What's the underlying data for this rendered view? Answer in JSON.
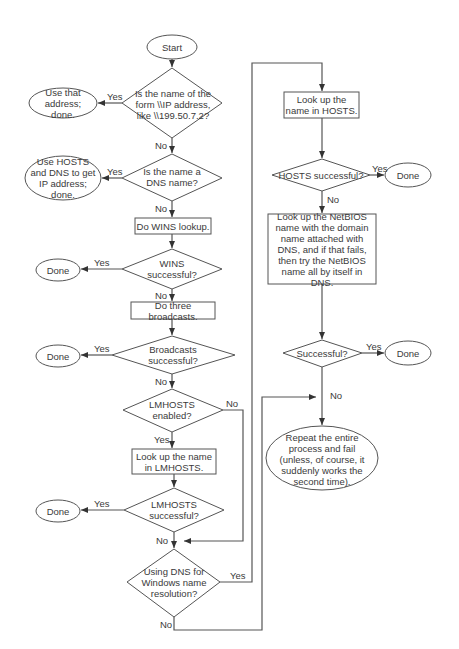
{
  "flowchart": {
    "nodes": {
      "start": "Start",
      "q_ip_form": "Is the name of the form \\\\IP address, like \\\\199.50.7.2?",
      "use_address": "Use that address; done.",
      "q_dns_name": "Is the name a DNS name?",
      "use_hosts_dns": "Use HOSTS and DNS to get IP address; done.",
      "wins_lookup": "Do WINS lookup.",
      "q_wins_ok": "WINS successful?",
      "done_wins": "Done",
      "broadcasts": "Do three broadcasts.",
      "q_broadcasts_ok": "Broadcasts successful?",
      "done_broadcasts": "Done",
      "q_lmhosts_enabled": "LMHOSTS enabled?",
      "lmhosts_lookup": "Look up the name in LMHOSTS.",
      "q_lmhosts_ok": "LMHOSTS successful?",
      "done_lmhosts": "Done",
      "q_dns_for_windows": "Using DNS for Windows name resolution?",
      "hosts_lookup": "Look up the name in HOSTS.",
      "q_hosts_ok": "HOSTS successful?",
      "done_hosts": "Done",
      "netbios_dns": "Look up the NetBIOS name with the domain name attached with DNS, and if that fails, then try the NetBIOS name all by itself in DNS.",
      "q_successful": "Successful?",
      "done_final": "Done",
      "repeat_fail": "Repeat the entire process and fail (unless, of course, it suddenly works the second time)."
    },
    "edges": {
      "yes": "Yes",
      "no": "No"
    }
  }
}
